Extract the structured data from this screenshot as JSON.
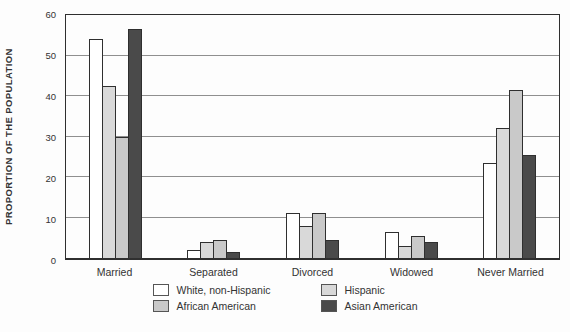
{
  "chart_data": {
    "type": "bar",
    "title": "",
    "ylabel": "PROPORTION OF THE POPULATION",
    "xlabel": "",
    "categories": [
      "Married",
      "Separated",
      "Divorced",
      "Widowed",
      "Never Married"
    ],
    "series": [
      {
        "name": "White, non-Hispanic",
        "color": "#ffffff",
        "values": [
          54,
          2,
          11,
          6.5,
          23.5
        ]
      },
      {
        "name": "Hispanic",
        "color": "#d9d9d9",
        "values": [
          42.5,
          4,
          8,
          3,
          32
        ]
      },
      {
        "name": "African American",
        "color": "#c9c9c9",
        "values": [
          30,
          4.5,
          11,
          5.5,
          41.5
        ]
      },
      {
        "name": "Asian American",
        "color": "#4a4a4a",
        "values": [
          56.5,
          1.5,
          4.5,
          4,
          25.5
        ]
      }
    ],
    "ylim": [
      0,
      60
    ],
    "yticks": [
      0,
      10,
      20,
      30,
      40,
      50,
      60
    ],
    "grid": true,
    "legend_position": "bottom"
  },
  "colors": {
    "frame": "#2f2f2f",
    "gridline": "#8f8f8f",
    "text": "#333333"
  }
}
